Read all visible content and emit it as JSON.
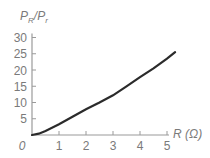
{
  "chart_data": {
    "type": "line",
    "title": "",
    "xlabel": "R (Ω)",
    "ylabel": "P_R/P_r",
    "ylabel_parts": {
      "main1": "P",
      "sub1": "R",
      "slash": "/",
      "main2": "P",
      "sub2": "r"
    },
    "xlim": [
      0,
      5.3
    ],
    "ylim": [
      0,
      30
    ],
    "x_ticks": [
      1,
      2,
      3,
      4,
      5
    ],
    "x_tick_labels": [
      "1",
      "2",
      "3",
      "4",
      "5"
    ],
    "y_ticks": [
      5,
      10,
      15,
      20,
      25,
      30
    ],
    "y_tick_labels": [
      "5",
      "10",
      "15",
      "20",
      "25",
      "30"
    ],
    "origin_label": "0",
    "grid": false,
    "series": [
      {
        "name": "P_R/P_r",
        "x": [
          0,
          0.25,
          0.5,
          1.0,
          1.5,
          2.0,
          2.5,
          3.0,
          3.5,
          4.0,
          4.5,
          5.0,
          5.3
        ],
        "y": [
          0,
          0.4,
          1.2,
          3.3,
          5.6,
          7.9,
          10.0,
          12.2,
          15.0,
          17.8,
          20.5,
          23.5,
          25.5
        ]
      }
    ]
  }
}
